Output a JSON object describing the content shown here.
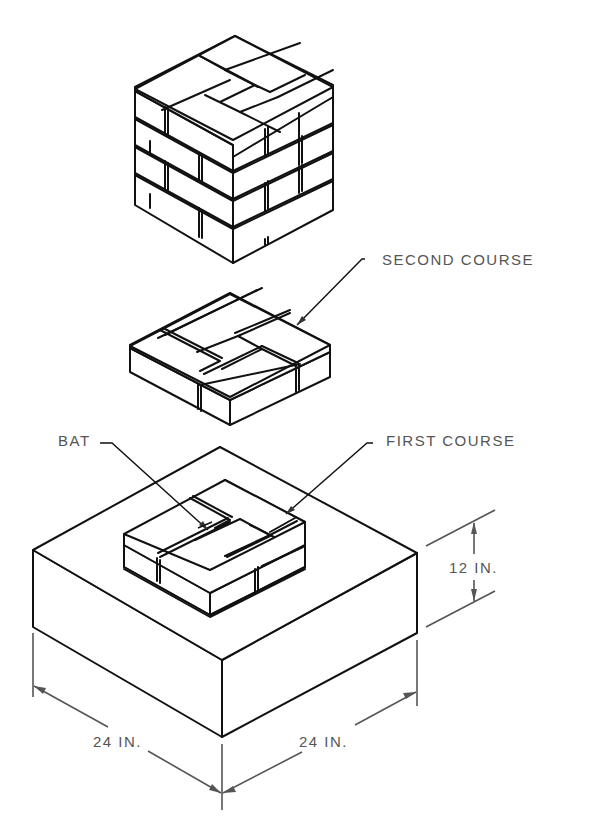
{
  "figure": {
    "labels": {
      "second_course": "SECOND COURSE",
      "first_course": "FIRST COURSE",
      "bat": "BAT",
      "height_dim": "12 IN.",
      "width_dim_left": "24 IN.",
      "width_dim_right": "24 IN."
    },
    "parts": [
      {
        "name": "brick-pier",
        "description": "Assembled pier, 4 courses"
      },
      {
        "name": "second-course",
        "description": "Pinwheel bond layer with central half brick"
      },
      {
        "name": "first-course",
        "description": "Pinwheel bond on footing"
      },
      {
        "name": "footing",
        "description": "24 x 24 x 12 in. block"
      }
    ],
    "colors": {
      "line": "#111111",
      "dimension": "#555555",
      "background": "#ffffff"
    }
  }
}
